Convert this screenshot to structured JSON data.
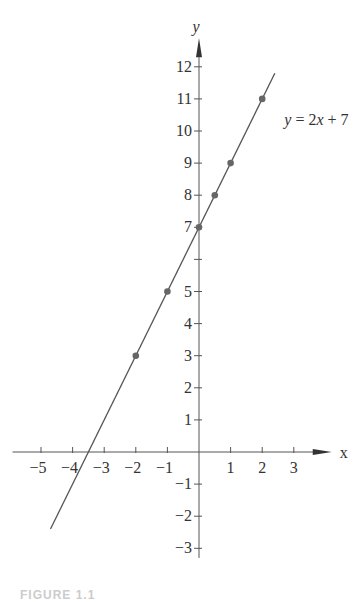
{
  "chart_data": {
    "type": "line",
    "title": "",
    "xlabel": "x",
    "ylabel": "y",
    "xlim": [
      -5.5,
      4
    ],
    "ylim": [
      -3.5,
      12.5
    ],
    "grid": false,
    "x_ticks": [
      -5,
      -4,
      -3,
      -2,
      -1,
      1,
      2,
      3
    ],
    "y_ticks": [
      -3,
      -2,
      -1,
      1,
      2,
      3,
      4,
      5,
      6,
      7,
      8,
      9,
      10,
      11,
      12
    ],
    "y_tick_labels": [
      "−3",
      "−2",
      "−1",
      "1",
      "2",
      "3",
      "4",
      "5",
      "",
      "7",
      "8",
      "9",
      "10",
      "11",
      "12"
    ],
    "x_tick_labels": [
      "−5",
      "−4",
      "−3",
      "−2",
      "−1",
      "1",
      "2",
      "3"
    ],
    "series": [
      {
        "name": "y = 2x + 7",
        "equation": "y = 2x + 7",
        "line_range_x": [
          -4.7,
          2.4
        ],
        "points": [
          {
            "x": -2,
            "y": 3
          },
          {
            "x": -1,
            "y": 5
          },
          {
            "x": 0,
            "y": 7
          },
          {
            "x": 0.5,
            "y": 8
          },
          {
            "x": 1,
            "y": 9
          },
          {
            "x": 2,
            "y": 11
          }
        ]
      }
    ],
    "annotations": [
      {
        "text": "y = 2x + 7",
        "x": 2.7,
        "y": 10.2
      }
    ],
    "colors": {
      "axis": "#555555",
      "line": "#555555",
      "point": "#666666"
    }
  },
  "labels": {
    "x_axis": "x",
    "y_axis": "y",
    "equation": "y = 2x + 7",
    "caption": "FIGURE 1.1"
  }
}
